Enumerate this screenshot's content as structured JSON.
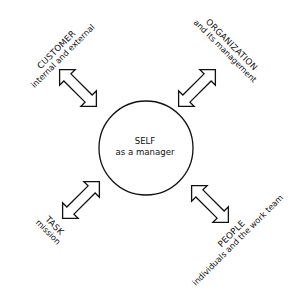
{
  "center": {
    "title": "SELF",
    "subtitle": "as a manager"
  },
  "nodes": [
    {
      "id": "customer",
      "title": "CUSTOMER",
      "subtitle": "internal and external",
      "position": "top-left"
    },
    {
      "id": "organization",
      "title": "ORGANIZATION",
      "subtitle": "and its management",
      "position": "top-right"
    },
    {
      "id": "task",
      "title": "TASK",
      "subtitle": "mission",
      "position": "bottom-left"
    },
    {
      "id": "people",
      "title": "PEOPLE",
      "subtitle": "individuals and the work team",
      "position": "bottom-right"
    }
  ],
  "arrows": [
    {
      "from": "self",
      "to": "customer",
      "type": "double-headed"
    },
    {
      "from": "self",
      "to": "organization",
      "type": "double-headed"
    },
    {
      "from": "self",
      "to": "task",
      "type": "double-headed"
    },
    {
      "from": "self",
      "to": "people",
      "type": "double-headed"
    }
  ],
  "colors": {
    "stroke": "#111111",
    "background": "#ffffff"
  }
}
